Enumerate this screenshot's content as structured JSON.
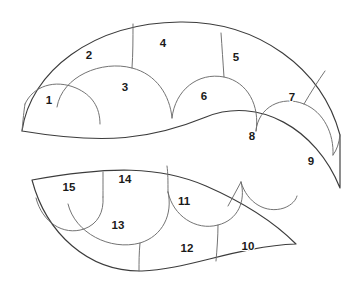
{
  "figure": {
    "background_color": "#ffffff",
    "outline_color": "#3c3c3c",
    "divider_color": "#6b6b6b",
    "label_color": "#1a1a1a",
    "canvas": {
      "width": 359,
      "height": 295
    }
  },
  "regions": [
    {
      "name": "upper-lobe",
      "label": "upper crescent",
      "cell_count": 9
    },
    {
      "name": "lower-lobe",
      "label": "lower crescent",
      "cell_count": 6
    }
  ],
  "cells": [
    {
      "id": 1,
      "label": "1",
      "x": 49,
      "y": 101,
      "region": "upper-lobe"
    },
    {
      "id": 2,
      "label": "2",
      "x": 89,
      "y": 56,
      "region": "upper-lobe"
    },
    {
      "id": 3,
      "label": "3",
      "x": 125,
      "y": 88,
      "region": "upper-lobe"
    },
    {
      "id": 4,
      "label": "4",
      "x": 163,
      "y": 44,
      "region": "upper-lobe"
    },
    {
      "id": 5,
      "label": "5",
      "x": 236,
      "y": 58,
      "region": "upper-lobe"
    },
    {
      "id": 6,
      "label": "6",
      "x": 204,
      "y": 97,
      "region": "upper-lobe"
    },
    {
      "id": 7,
      "label": "7",
      "x": 292,
      "y": 98,
      "region": "upper-lobe"
    },
    {
      "id": 8,
      "label": "8",
      "x": 252,
      "y": 137,
      "region": "upper-lobe"
    },
    {
      "id": 9,
      "label": "9",
      "x": 311,
      "y": 162,
      "region": "upper-lobe"
    },
    {
      "id": 10,
      "label": "10",
      "x": 248,
      "y": 247,
      "region": "lower-lobe"
    },
    {
      "id": 11,
      "label": "11",
      "x": 184,
      "y": 202,
      "region": "lower-lobe"
    },
    {
      "id": 12,
      "label": "12",
      "x": 187,
      "y": 249,
      "region": "lower-lobe"
    },
    {
      "id": 13,
      "label": "13",
      "x": 118,
      "y": 226,
      "region": "lower-lobe"
    },
    {
      "id": 14,
      "label": "14",
      "x": 125,
      "y": 180,
      "region": "lower-lobe"
    },
    {
      "id": 15,
      "label": "15",
      "x": 69,
      "y": 188,
      "region": "lower-lobe"
    }
  ]
}
